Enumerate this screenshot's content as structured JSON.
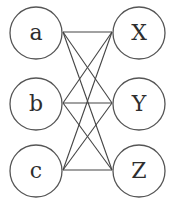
{
  "diagram": {
    "type": "complete-bipartite-graph",
    "left_nodes": [
      {
        "id": "a",
        "label": "a",
        "cx": 36,
        "cy": 33
      },
      {
        "id": "b",
        "label": "b",
        "cx": 36,
        "cy": 104
      },
      {
        "id": "c",
        "label": "c",
        "cx": 36,
        "cy": 171
      }
    ],
    "right_nodes": [
      {
        "id": "X",
        "label": "X",
        "cx": 139,
        "cy": 33
      },
      {
        "id": "Y",
        "label": "Y",
        "cx": 139,
        "cy": 104
      },
      {
        "id": "Z",
        "label": "Z",
        "cx": 139,
        "cy": 171
      }
    ],
    "radius": 26,
    "edges": [
      [
        "a",
        "X"
      ],
      [
        "a",
        "Y"
      ],
      [
        "a",
        "Z"
      ],
      [
        "b",
        "X"
      ],
      [
        "b",
        "Y"
      ],
      [
        "b",
        "Z"
      ],
      [
        "c",
        "X"
      ],
      [
        "c",
        "Y"
      ],
      [
        "c",
        "Z"
      ]
    ],
    "colors": {
      "stroke": "#555555",
      "text": "#2e2e2e",
      "background": "#ffffff"
    }
  }
}
